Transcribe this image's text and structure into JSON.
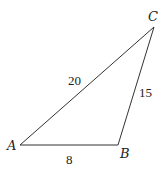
{
  "diagram": {
    "type": "triangle",
    "vertices": {
      "A": {
        "label": "A",
        "x": 20,
        "y": 145
      },
      "B": {
        "label": "B",
        "x": 118,
        "y": 145
      },
      "C": {
        "label": "C",
        "x": 154,
        "y": 27
      }
    },
    "sides": {
      "AB": {
        "label": "8",
        "length": 8
      },
      "BC": {
        "label": "15",
        "length": 15
      },
      "AC": {
        "label": "20",
        "length": 20
      }
    },
    "colors": {
      "stroke": "#333333",
      "text": "#222222",
      "background": "#ffffff"
    }
  }
}
